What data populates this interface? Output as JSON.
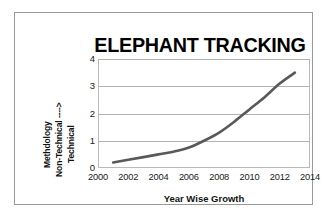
{
  "chart_data": {
    "type": "line",
    "title": "ELEPHANT TRACKING",
    "xlabel": "Year Wise Growth",
    "ylabel": "Methdology Non-Technical ----> Technical",
    "ylabel_parts": [
      "Methdology",
      "Non-Technical ---->",
      "Technical"
    ],
    "x": [
      2001,
      2002,
      2003,
      2004,
      2005,
      2006,
      2007,
      2008,
      2009,
      2010,
      2011,
      2012,
      2013
    ],
    "values": [
      0.2,
      0.3,
      0.4,
      0.5,
      0.6,
      0.75,
      1.0,
      1.3,
      1.7,
      2.15,
      2.6,
      3.1,
      3.5
    ],
    "series": [
      {
        "name": "Methodology growth",
        "values": [
          0.2,
          0.3,
          0.4,
          0.5,
          0.6,
          0.75,
          1.0,
          1.3,
          1.7,
          2.15,
          2.6,
          3.1,
          3.5
        ],
        "color": "#595959"
      }
    ],
    "xlim": [
      2000,
      2014
    ],
    "ylim": [
      0,
      4
    ],
    "xticks": [
      "2000",
      "2002",
      "2004",
      "2006",
      "2008",
      "2010",
      "2012",
      "2014"
    ],
    "xtick_values": [
      2000,
      2002,
      2004,
      2006,
      2008,
      2010,
      2012,
      2014
    ],
    "yticks": [
      "0",
      "1",
      "2",
      "3",
      "4"
    ],
    "ytick_values": [
      0,
      1,
      2,
      3,
      4
    ],
    "grid": true,
    "grid_axis": "y",
    "legend": false,
    "line_color": "#595959",
    "grid_color": "#b3b3b3",
    "plot_border_color": "#b9b9b9",
    "frame_color": "#9a9a9a",
    "background": "#ffffff"
  }
}
